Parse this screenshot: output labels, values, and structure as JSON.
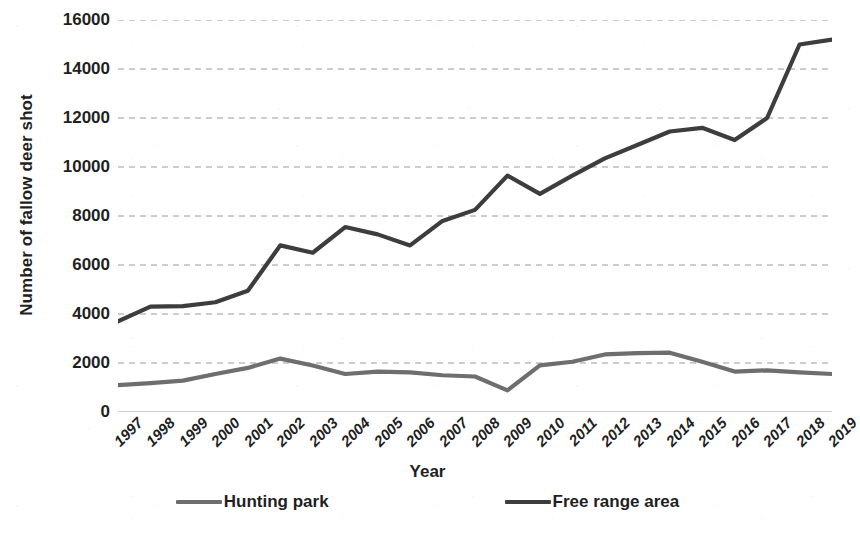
{
  "chart_data": {
    "type": "line",
    "title": "",
    "xlabel": "Year",
    "ylabel": "Number of fallow deer shot",
    "categories": [
      "1997",
      "1998",
      "1999",
      "2000",
      "2001",
      "2002",
      "2003",
      "2004",
      "2005",
      "2006",
      "2007",
      "2008",
      "2009",
      "2010",
      "2011",
      "2012",
      "2013",
      "2014",
      "2015",
      "2016",
      "2017",
      "2018",
      "2019"
    ],
    "ylim": [
      0,
      16000
    ],
    "yticks": [
      0,
      2000,
      4000,
      6000,
      8000,
      10000,
      12000,
      14000,
      16000
    ],
    "grid": "horizontal-dashed",
    "legend_position": "bottom",
    "series": [
      {
        "name": "Hunting park",
        "color": "#6e6e6e",
        "values": [
          1100,
          1180,
          1280,
          1550,
          1800,
          2180,
          1900,
          1550,
          1650,
          1620,
          1500,
          1450,
          880,
          1900,
          2050,
          2350,
          2400,
          2420,
          2050,
          1650,
          1700,
          1620,
          1550
        ]
      },
      {
        "name": "Free range area",
        "color": "#3d3d3d",
        "values": [
          3700,
          4300,
          4320,
          4480,
          4950,
          6800,
          6500,
          7550,
          7250,
          6800,
          7800,
          8250,
          9650,
          8900,
          9650,
          10350,
          10900,
          11450,
          11600,
          11100,
          12000,
          15000,
          15200
        ]
      }
    ]
  },
  "axis": {
    "y_title": "Number of fallow deer shot",
    "x_title": "Year"
  },
  "legend": {
    "items": [
      {
        "label": "Hunting park",
        "color": "#6e6e6e"
      },
      {
        "label": "Free range area",
        "color": "#3d3d3d"
      }
    ]
  },
  "style": {
    "gridline_color": "#9a9a9a",
    "axis_color": "#bdbdbd",
    "text_color": "#1f1f1f",
    "background": "#ffffff"
  }
}
